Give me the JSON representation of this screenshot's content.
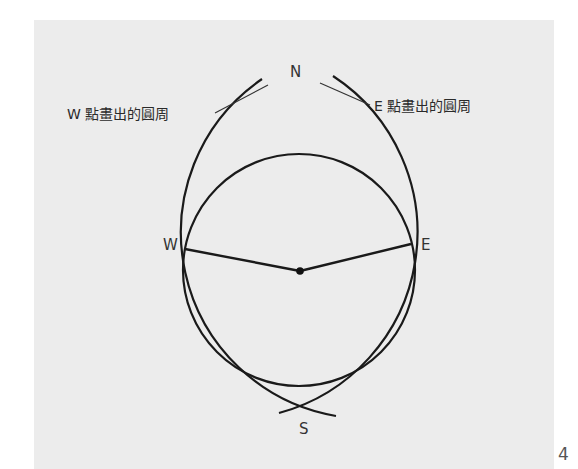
{
  "diagram": {
    "labels": {
      "north": "N",
      "south": "S",
      "west": "W",
      "east": "E"
    },
    "captions": {
      "west_circle": "W 點畫出的圓周",
      "east_circle": "E 點畫出的圓周"
    },
    "colors": {
      "background": "#ececec",
      "stroke": "#1a1a1a"
    }
  },
  "page": {
    "number": "4"
  }
}
